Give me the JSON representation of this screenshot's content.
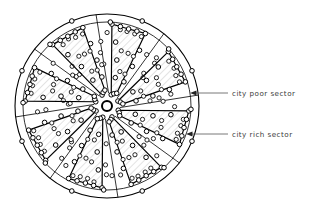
{
  "diagram": {
    "shape": "circle",
    "center": {
      "x": 107,
      "y": 106
    },
    "radius_outer": 92,
    "radius_inner_ring": 84,
    "hub_radius": 5,
    "sector_count": 16,
    "rich_sector_count": 8,
    "poor_sector_count": 8,
    "fill_color": "#ffffff",
    "hatch_color": "#b9b9b9",
    "line_color": "#000000",
    "node_fill": "#ffffff",
    "node_stroke": "#000000"
  },
  "annotations": [
    {
      "id": "poor",
      "label": "city poor sector",
      "arrow_tip": {
        "x": 190,
        "y": 93
      },
      "leader_end": {
        "x": 228,
        "y": 93
      },
      "text_x": 232,
      "text_y": 96
    },
    {
      "id": "rich",
      "label": "city rich sector",
      "arrow_tip": {
        "x": 186,
        "y": 134
      },
      "leader_end": {
        "x": 228,
        "y": 134
      },
      "text_x": 232,
      "text_y": 137
    }
  ],
  "chart_data": {
    "type": "pie",
    "categories": [
      "city rich sector",
      "city poor sector",
      "city rich sector",
      "city poor sector",
      "city rich sector",
      "city poor sector",
      "city rich sector",
      "city poor sector",
      "city rich sector",
      "city poor sector",
      "city rich sector",
      "city poor sector",
      "city rich sector",
      "city poor sector",
      "city rich sector",
      "city poor sector"
    ],
    "values": [
      1,
      1,
      1,
      1,
      1,
      1,
      1,
      1,
      1,
      1,
      1,
      1,
      1,
      1,
      1,
      1
    ],
    "legend": [
      "city poor sector",
      "city rich sector"
    ],
    "legend_position": "right",
    "xlabel": "",
    "ylabel": "",
    "grid": false
  }
}
